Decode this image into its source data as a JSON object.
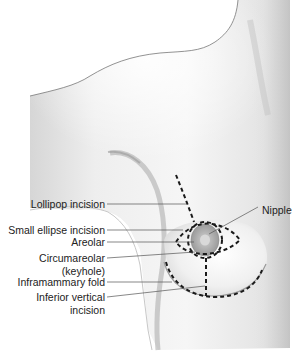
{
  "figure": {
    "colors": {
      "skin_light": "#f4f4f4",
      "skin_shadow": "#b8b8b8",
      "areola": "#a9a9a9",
      "incision_dash": "#1a1a1a",
      "leader_line": "#555555",
      "label_text": "#222222"
    }
  },
  "labels": {
    "lollipop": "Lollipop incision",
    "small_ellipse": "Small ellipse incision",
    "areolar": "Areolar",
    "circumareolar_line1": "Circumareolar",
    "circumareolar_line2": "(keyhole)",
    "inframammary": "Inframammary fold",
    "inferior_line1": "Inferior vertical",
    "inferior_line2": "incision",
    "nipple": "Nipple"
  }
}
